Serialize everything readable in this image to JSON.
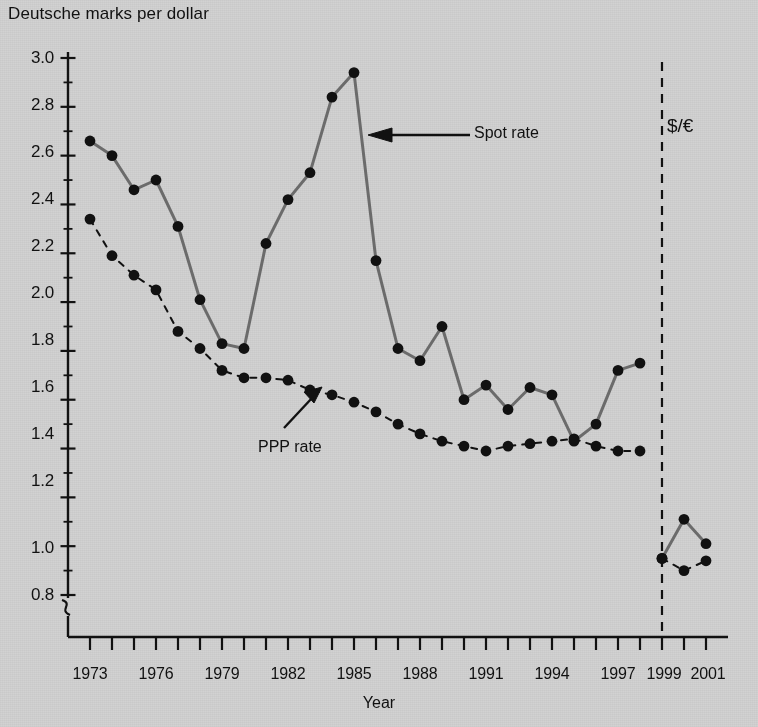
{
  "chart_data": {
    "type": "line",
    "title": "",
    "ylabel": "Deutsche marks per dollar",
    "xlabel": "Year",
    "ylim": [
      0.8,
      3.0
    ],
    "xlim": [
      1972,
      2001.5
    ],
    "ytick_values": [
      0.8,
      1.0,
      1.2,
      1.4,
      1.6,
      1.8,
      2.0,
      2.2,
      2.4,
      2.6,
      2.8,
      3.0
    ],
    "ytick_labels": [
      "0.8",
      "1.0",
      "1.2",
      "1.4",
      "1.6",
      "1.8",
      "2.0",
      "2.2",
      "2.4",
      "2.6",
      "2.8",
      "3.0"
    ],
    "yminor_step": 0.1,
    "axis_break": true,
    "axis_break_note": "y-axis broken below 0.8",
    "xtick_values": [
      1973,
      1974,
      1975,
      1976,
      1977,
      1978,
      1979,
      1980,
      1981,
      1982,
      1983,
      1984,
      1985,
      1986,
      1987,
      1988,
      1989,
      1990,
      1991,
      1992,
      1993,
      1994,
      1995,
      1996,
      1997,
      1998,
      1999,
      2000,
      2001
    ],
    "xtick_labels_shown": [
      "1973",
      "1976",
      "1979",
      "1982",
      "1985",
      "1988",
      "1991",
      "1994",
      "1997",
      "1999",
      "2001"
    ],
    "xtick_labels_years": [
      1973,
      1976,
      1979,
      1982,
      1985,
      1988,
      1991,
      1994,
      1997,
      1999,
      2001
    ],
    "grid": false,
    "legend": "none (inline annotations)",
    "series": [
      {
        "name": "Spot rate",
        "style": "solid",
        "color": "#6b6b6b",
        "marker": "filled-circle",
        "x": [
          1973,
          1974,
          1975,
          1976,
          1977,
          1978,
          1979,
          1980,
          1981,
          1982,
          1983,
          1984,
          1985,
          1986,
          1987,
          1988,
          1989,
          1990,
          1991,
          1992,
          1993,
          1994,
          1995,
          1996,
          1997,
          1998
        ],
        "values": [
          2.66,
          2.6,
          2.46,
          2.5,
          2.31,
          2.01,
          1.83,
          1.81,
          2.24,
          2.42,
          2.53,
          2.84,
          2.94,
          2.17,
          1.81,
          1.76,
          1.9,
          1.6,
          1.66,
          1.56,
          1.65,
          1.62,
          1.43,
          1.5,
          1.72,
          1.75
        ]
      },
      {
        "name": "PPP rate",
        "style": "dashed",
        "color": "#111111",
        "marker": "filled-circle",
        "x": [
          1973,
          1974,
          1975,
          1976,
          1977,
          1978,
          1979,
          1980,
          1981,
          1982,
          1983,
          1984,
          1985,
          1986,
          1987,
          1988,
          1989,
          1990,
          1991,
          1992,
          1993,
          1994,
          1995,
          1996,
          1997,
          1998
        ],
        "values": [
          2.34,
          2.19,
          2.11,
          2.05,
          1.88,
          1.81,
          1.72,
          1.69,
          1.69,
          1.68,
          1.64,
          1.62,
          1.59,
          1.55,
          1.5,
          1.46,
          1.43,
          1.41,
          1.39,
          1.41,
          1.42,
          1.43,
          1.44,
          1.41,
          1.39,
          1.39
        ]
      },
      {
        "name": "Spot rate ($/euro)",
        "style": "solid",
        "color": "#6b6b6b",
        "marker": "filled-circle",
        "segment": "euro",
        "x": [
          1999,
          2000,
          2001
        ],
        "values": [
          0.95,
          1.11,
          1.01
        ]
      },
      {
        "name": "PPP rate ($/euro)",
        "style": "dashed",
        "color": "#111111",
        "marker": "filled-circle",
        "segment": "euro",
        "x": [
          1999,
          2000,
          2001
        ],
        "values": [
          0.95,
          0.9,
          0.94
        ]
      }
    ],
    "annotations": [
      {
        "name": "spot-rate-annotation",
        "text": "Spot rate",
        "points_to": "spot rate curve near 1985"
      },
      {
        "name": "ppp-rate-annotation",
        "text": "PPP rate",
        "points_to": "PPP rate curve near 1983"
      },
      {
        "name": "euro-regime-label",
        "text": "$/€",
        "points_to": "region right of 1999 divider"
      }
    ],
    "divider": {
      "name": "euro-divider",
      "x": 1999,
      "style": "dashed-vertical"
    }
  },
  "axis": {
    "y_title": "Deutsche marks per dollar",
    "x_title": "Year"
  },
  "labels": {
    "spot_rate": "Spot rate",
    "ppp_rate": "PPP rate",
    "euro": "$/€"
  }
}
